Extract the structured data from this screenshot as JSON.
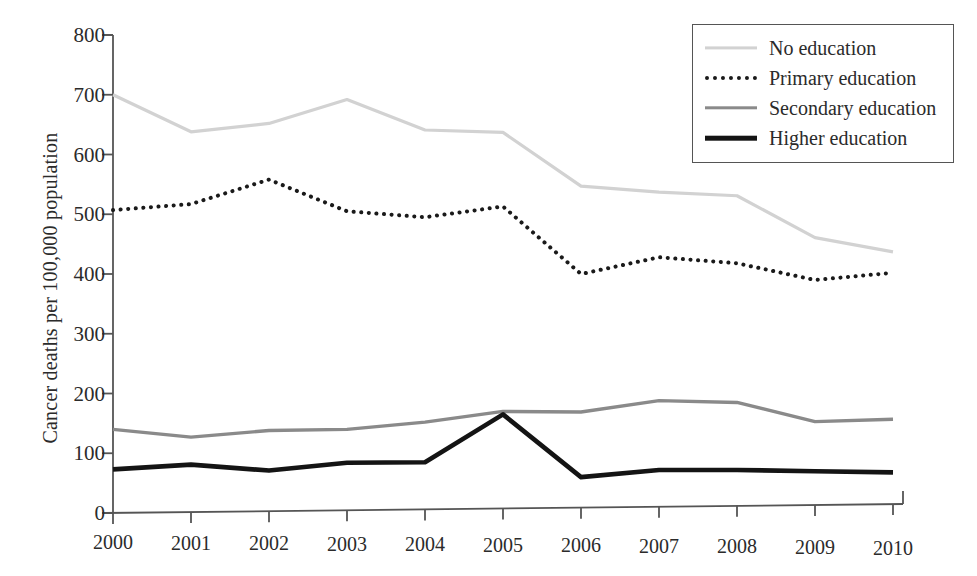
{
  "chart_data": {
    "type": "line",
    "title": "",
    "xlabel": "",
    "ylabel": "Cancer deaths per 100,000 population",
    "categories": [
      "2000",
      "2001",
      "2002",
      "2003",
      "2004",
      "2005",
      "2006",
      "2007",
      "2008",
      "2009",
      "2010"
    ],
    "x": [
      2000,
      2001,
      2002,
      2003,
      2004,
      2005,
      2006,
      2007,
      2008,
      2009,
      2010
    ],
    "ylim": [
      0,
      800
    ],
    "yticks": [
      0,
      100,
      200,
      300,
      400,
      500,
      600,
      700,
      800
    ],
    "ytick_labels": [
      "0",
      "100",
      "200",
      "300",
      "400",
      "500",
      "600",
      "700",
      "800"
    ],
    "grid": false,
    "legend_position": "top-right",
    "series": [
      {
        "name": "No education",
        "style": "solid",
        "color": "#d2d2d2",
        "width": 3.2,
        "values": [
          700,
          638,
          652,
          692,
          641,
          637,
          547,
          537,
          531,
          461,
          437
        ]
      },
      {
        "name": "Primary education",
        "style": "dotted",
        "color": "#1a1a1a",
        "width": 4.0,
        "values": [
          507,
          517,
          558,
          505,
          495,
          513,
          400,
          428,
          418,
          390,
          402
        ]
      },
      {
        "name": "Secondary education",
        "style": "solid",
        "color": "#8a8a8a",
        "width": 3.4,
        "values": [
          140,
          127,
          138,
          140,
          152,
          170,
          169,
          188,
          185,
          153,
          157
        ]
      },
      {
        "name": "Higher education",
        "style": "solid",
        "color": "#141414",
        "width": 4.6,
        "values": [
          73,
          81,
          71,
          84,
          85,
          165,
          60,
          72,
          72,
          70,
          68
        ]
      }
    ]
  },
  "axes": {
    "axis_color": "#555555",
    "y_axis_name": "y-axis",
    "x_axis_name": "x-axis"
  },
  "legend": {
    "entries": [
      {
        "label": "No education"
      },
      {
        "label": "Primary education"
      },
      {
        "label": "Secondary education"
      },
      {
        "label": "Higher education"
      }
    ]
  }
}
